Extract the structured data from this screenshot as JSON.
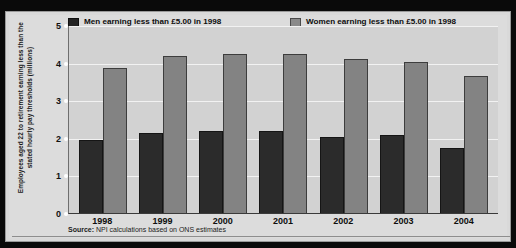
{
  "ylabel": "Employees aged 22 to retirement earning less than the stated hourly pay thresholds (millions)",
  "source_prefix": "Source:",
  "source_text": " NPI calculations based on ONS estimates",
  "legend": [
    {
      "key": "men",
      "line1": "Men earning less than £5.00 in 1998",
      "line2": "uprated for the average rise in earnings",
      "color": "#232323"
    },
    {
      "key": "women",
      "line1": "Women earning less than £5.00 in 1998",
      "line2": "uprated for the average rise in earnings",
      "color": "#8a8a8a"
    }
  ],
  "chart_data": {
    "type": "bar",
    "title": "",
    "xlabel": "",
    "ylabel": "Employees aged 22 to retirement earning less than the stated hourly pay thresholds (millions)",
    "categories": [
      "1998",
      "1999",
      "2000",
      "2001",
      "2002",
      "2003",
      "2004"
    ],
    "series": [
      {
        "name": "Men earning less than £5.00 in 1998 uprated for the average rise in earnings",
        "color": "#2b2b2b",
        "values": [
          1.93,
          2.13,
          2.18,
          2.18,
          2.02,
          2.07,
          1.73
        ]
      },
      {
        "name": "Women earning less than £5.00 in 1998 uprated for the average rise in earnings",
        "color": "#838383",
        "values": [
          3.87,
          4.18,
          4.24,
          4.24,
          4.1,
          4.02,
          3.65
        ]
      }
    ],
    "yticks": [
      0,
      1,
      2,
      3,
      4,
      5
    ],
    "ylim": [
      0,
      5
    ],
    "grid": true,
    "legend_position": "top"
  }
}
